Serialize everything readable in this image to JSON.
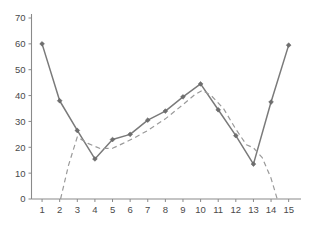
{
  "chart_data": {
    "type": "line",
    "title": "",
    "xlabel": "",
    "ylabel": "",
    "xlim": [
      0.4,
      15.7
    ],
    "ylim": [
      0,
      70
    ],
    "grid": false,
    "legend": "none",
    "x": [
      1,
      2,
      3,
      4,
      5,
      6,
      7,
      8,
      9,
      10,
      11,
      12,
      13,
      14,
      15
    ],
    "xticks": [
      "1",
      "2",
      "3",
      "4",
      "5",
      "6",
      "7",
      "8",
      "9",
      "10",
      "11",
      "12",
      "13",
      "14",
      "15"
    ],
    "yticks": [
      "0",
      "10",
      "20",
      "30",
      "40",
      "50",
      "60",
      "70"
    ],
    "ytick_values": [
      0,
      10,
      20,
      30,
      40,
      50,
      60,
      70
    ],
    "series": [
      {
        "name": "observed",
        "style": "solid",
        "marker": "diamond",
        "color": "#7a7a7a",
        "values": [
          60,
          38,
          26.5,
          15.5,
          23,
          25,
          30.5,
          34,
          39.5,
          44.5,
          34.5,
          24.5,
          13.5,
          37.5,
          59.5
        ]
      },
      {
        "name": "fitted",
        "style": "dashed",
        "marker": "none",
        "color": "#9a9a9a",
        "x": [
          2.05,
          2.5,
          3.0,
          3.6,
          4.3,
          5.0,
          5.6,
          6.2,
          7.0,
          8.0,
          9.0,
          9.7,
          10.1,
          10.6,
          11.3,
          12.0,
          12.6,
          13.0,
          13.5,
          14.0,
          14.35
        ],
        "values": [
          0,
          13,
          24,
          21.5,
          19.5,
          19.6,
          21.5,
          23.5,
          26.5,
          31,
          36.5,
          40.5,
          42,
          40,
          35,
          27,
          21,
          19.8,
          16,
          8,
          0
        ]
      }
    ]
  }
}
